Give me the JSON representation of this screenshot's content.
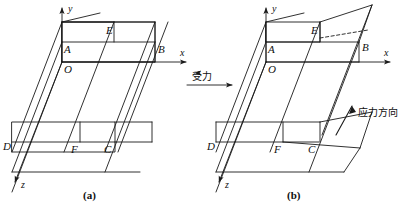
{
  "figure": {
    "title_a": "(a)",
    "title_b": "(b)",
    "background_color": "#ffffff",
    "stroke_color": "#1a1a1a"
  },
  "panel_a": {
    "caption": "(a)",
    "axes": {
      "y_label": "y",
      "x_label": "x",
      "z_label": "z"
    },
    "vertices": {
      "O": "O",
      "A": "A",
      "B": "B",
      "C": "C",
      "D": "D",
      "E": "E",
      "F": "F"
    }
  },
  "panel_b": {
    "caption": "(b)",
    "axes": {
      "y_label": "y",
      "x_label": "x",
      "z_label": "z"
    },
    "vertices": {
      "O": "O",
      "A": "A",
      "B": "B",
      "C": "C",
      "D": "D",
      "E": "E",
      "F": "F"
    }
  },
  "annotations": {
    "force_label": "受力",
    "stress_direction_label": "应力方向"
  }
}
